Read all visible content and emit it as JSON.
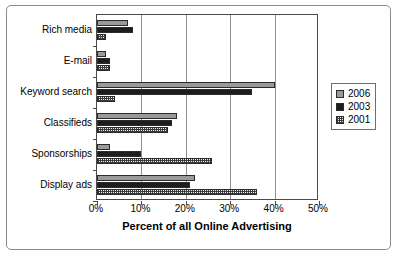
{
  "chart_data": {
    "type": "bar",
    "orientation": "horizontal",
    "title": "",
    "xlabel": "Percent of all Online Advertising",
    "ylabel": "",
    "xlim": [
      0,
      50
    ],
    "xticks": [
      "0%",
      "10%",
      "20%",
      "30%",
      "40%",
      "50%"
    ],
    "xtick_values": [
      0,
      10,
      20,
      30,
      40,
      50
    ],
    "grid": true,
    "grid_axis": "x",
    "legend_position": "right",
    "categories": [
      "Rich media",
      "E-mail",
      "Keyword search",
      "Classifieds",
      "Sponsorships",
      "Display ads"
    ],
    "series": [
      {
        "name": "2006",
        "color": "#9a9a9a",
        "values": [
          7,
          2,
          40,
          18,
          3,
          22
        ]
      },
      {
        "name": "2003",
        "color": "#1d1d1d",
        "values": [
          8,
          3,
          35,
          17,
          10,
          21
        ]
      },
      {
        "name": "2001",
        "color": "#efefef",
        "pattern": "checker",
        "values": [
          2,
          3,
          4,
          16,
          26,
          36
        ]
      }
    ]
  },
  "legend": {
    "entries": [
      {
        "label": "2006",
        "swatch": "swatch-2006"
      },
      {
        "label": "2003",
        "swatch": "swatch-2003"
      },
      {
        "label": "2001",
        "swatch": "swatch-2001"
      }
    ]
  }
}
